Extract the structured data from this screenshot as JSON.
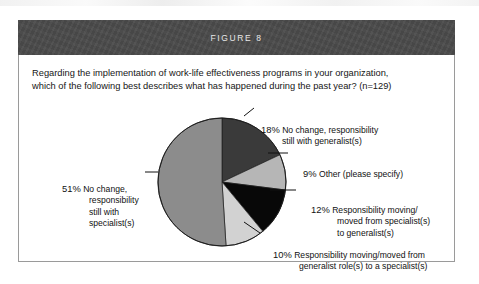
{
  "figure": {
    "title": "FIGURE 8",
    "question_line1": "Regarding the implementation of work-life effectiveness programs in your organization,",
    "question_line2": "which of the following best describes what has happened during the past year? (n=129)",
    "sample_size": "n=129"
  },
  "chart_data": {
    "type": "pie",
    "title": "FIGURE 8",
    "subtitle": "Regarding the implementation of work-life effectiveness programs in your organization, which of the following best describes what has happened during the past year? (n=129)",
    "xlabel": "",
    "ylabel": "",
    "legend_position": "callout-labels",
    "grid": false,
    "start_angle_deg": 0,
    "direction": "clockwise",
    "categories": [
      "No change, responsibility still with generalist(s)",
      "Other (please specify)",
      "Responsibility moving/moved from specialist(s) to generalist(s)",
      "Responsibility moving/moved from generalist role(s) to a specialist(s)",
      "No change, responsibility still with specialist(s)"
    ],
    "values": [
      18,
      9,
      12,
      10,
      51
    ],
    "value_labels": [
      "18%",
      "9%",
      "12%",
      "10%",
      "51%"
    ],
    "colors": [
      "#3a3a3a",
      "#b6b6b6",
      "#080808",
      "#d2d2d2",
      "#8c8c8c"
    ],
    "slices": [
      {
        "pct": 18,
        "pct_label": "18%",
        "color": "#3a3a3a",
        "label_lines": [
          "No change, responsibility",
          "still with generalist(s)"
        ]
      },
      {
        "pct": 9,
        "pct_label": "9%",
        "color": "#b6b6b6",
        "label_lines": [
          "Other (please specify)"
        ]
      },
      {
        "pct": 12,
        "pct_label": "12%",
        "color": "#080808",
        "label_lines": [
          "Responsibility moving/",
          "moved from specialist(s)",
          "to generalist(s)"
        ]
      },
      {
        "pct": 10,
        "pct_label": "10%",
        "color": "#d2d2d2",
        "label_lines": [
          "Responsibility moving/moved from",
          "generalist role(s) to a specialist(s)"
        ]
      },
      {
        "pct": 51,
        "pct_label": "51%",
        "color": "#8c8c8c",
        "label_lines": [
          "No change,",
          "responsibility",
          "still with",
          "specialist(s)"
        ]
      }
    ]
  },
  "style": {
    "header_background": "#4a4a4a",
    "header_text": "#e8e8e8",
    "frame_border": "#9a9a9a",
    "page_background": "#ffffff",
    "body_text": "#161616"
  }
}
